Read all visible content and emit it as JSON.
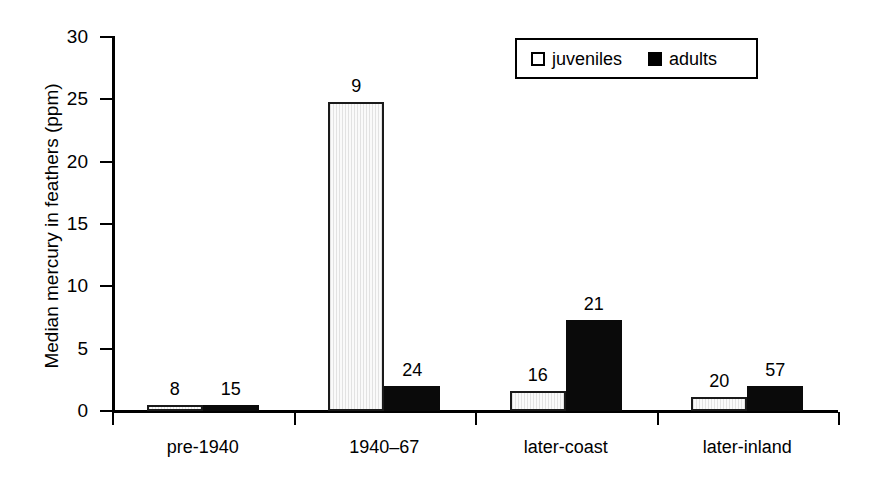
{
  "chart_data": {
    "type": "bar",
    "title": "",
    "xlabel": "",
    "ylabel": "Median mercury in feathers (ppm)",
    "ylim": [
      0,
      30
    ],
    "ytick_labels": [
      "0",
      "5",
      "10",
      "15",
      "20",
      "25",
      "30"
    ],
    "ytick_values": [
      0,
      5,
      10,
      15,
      20,
      25,
      30
    ],
    "grid": false,
    "legend_position": "top-right",
    "categories": [
      "pre-1940",
      "1940–67",
      "later-coast",
      "later-inland"
    ],
    "series": [
      {
        "name": "juveniles",
        "color": "#f0f0f0",
        "values": [
          0.5,
          24.8,
          1.6,
          1.1
        ],
        "point_labels": [
          "8",
          "9",
          "16",
          "20"
        ]
      },
      {
        "name": "adults",
        "color": "#000000",
        "values": [
          0.5,
          2.0,
          7.3,
          2.0
        ],
        "point_labels": [
          "15",
          "24",
          "21",
          "57"
        ]
      }
    ],
    "annotations": "Numbers above bars are sample sizes (n)."
  },
  "axes": {
    "y_title": "Median mercury in feathers (ppm)",
    "y_ticks": [
      {
        "label": "30",
        "value": 30
      },
      {
        "label": "25",
        "value": 25
      },
      {
        "label": "20",
        "value": 20
      },
      {
        "label": "15",
        "value": 15
      },
      {
        "label": "10",
        "value": 10
      },
      {
        "label": "5",
        "value": 5
      },
      {
        "label": "0",
        "value": 0
      }
    ],
    "x_categories": [
      {
        "label": "pre-1940"
      },
      {
        "label": "1940–67"
      },
      {
        "label": "later-coast"
      },
      {
        "label": "later-inland"
      }
    ]
  },
  "legend": {
    "entries": [
      {
        "label": "juveniles",
        "swatch": "open-square"
      },
      {
        "label": "adults",
        "swatch": "filled-square"
      }
    ]
  },
  "bars": [
    {
      "group": "pre-1940",
      "series": "juveniles",
      "value": 0.5,
      "label": "8"
    },
    {
      "group": "pre-1940",
      "series": "adults",
      "value": 0.5,
      "label": "15"
    },
    {
      "group": "1940–67",
      "series": "juveniles",
      "value": 24.8,
      "label": "9"
    },
    {
      "group": "1940–67",
      "series": "adults",
      "value": 2.0,
      "label": "24"
    },
    {
      "group": "later-coast",
      "series": "juveniles",
      "value": 1.6,
      "label": "16"
    },
    {
      "group": "later-coast",
      "series": "adults",
      "value": 7.3,
      "label": "21"
    },
    {
      "group": "later-inland",
      "series": "juveniles",
      "value": 1.1,
      "label": "20"
    },
    {
      "group": "later-inland",
      "series": "adults",
      "value": 2.0,
      "label": "57"
    }
  ]
}
